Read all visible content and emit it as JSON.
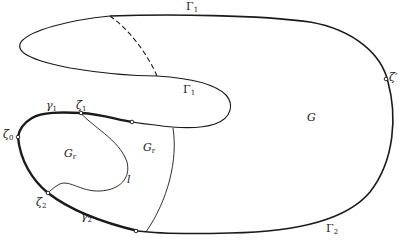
{
  "figure": {
    "type": "domain-boundary-diagram",
    "colors": {
      "stroke": "#1a1a1a",
      "background": "#ffffff"
    }
  },
  "labels": {
    "Gamma1_top": {
      "base": "Γ",
      "sub": "1"
    },
    "Gamma1_inner": {
      "base": "Γ",
      "sub": "1"
    },
    "Gamma2": {
      "base": "Γ",
      "sub": "2"
    },
    "gamma1": {
      "base": "γ",
      "sub": "1"
    },
    "gamma2": {
      "base": "γ",
      "sub": "2"
    },
    "zeta0": {
      "base": "ζ",
      "sub": "0"
    },
    "zeta1": {
      "base": "ζ",
      "sub": "1"
    },
    "zeta2": {
      "base": "ζ",
      "sub": "2"
    },
    "zeta_prime": {
      "base": "ζ′"
    },
    "G": {
      "base": "G"
    },
    "Gr_left": {
      "base": "G",
      "sub": "r"
    },
    "Gr_right": {
      "base": "G",
      "sub": "r"
    },
    "l": {
      "base": "l"
    }
  }
}
